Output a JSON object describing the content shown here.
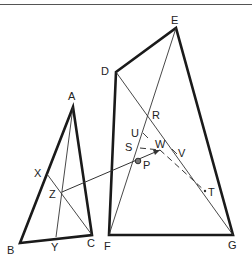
{
  "figure": {
    "colors": {
      "stroke": "#1a1a1a",
      "thin": "#333333",
      "background": "#ffffff"
    }
  },
  "labels": {
    "A": "A",
    "B": "B",
    "C": "C",
    "X": "X",
    "Y": "Y",
    "Z": "Z",
    "D": "D",
    "E": "E",
    "F": "F",
    "G": "G",
    "R": "R",
    "U": "U",
    "S": "S",
    "W": "W",
    "V": "V",
    "P": "P",
    "T": "T"
  },
  "points": {
    "A": [
      73,
      107
    ],
    "B": [
      20,
      243
    ],
    "C": [
      92,
      235
    ],
    "X": [
      47,
      174
    ],
    "Y": [
      56,
      237
    ],
    "Z": [
      62,
      192
    ],
    "D": [
      116,
      72
    ],
    "E": [
      176,
      28
    ],
    "F": [
      109,
      235
    ],
    "G": [
      233,
      235
    ],
    "R": [
      150,
      117
    ],
    "U": [
      145,
      136
    ],
    "S": [
      140,
      148
    ],
    "W": [
      160,
      150
    ],
    "V": [
      175,
      152
    ],
    "P": [
      138,
      161
    ],
    "T": [
      205,
      191
    ]
  }
}
